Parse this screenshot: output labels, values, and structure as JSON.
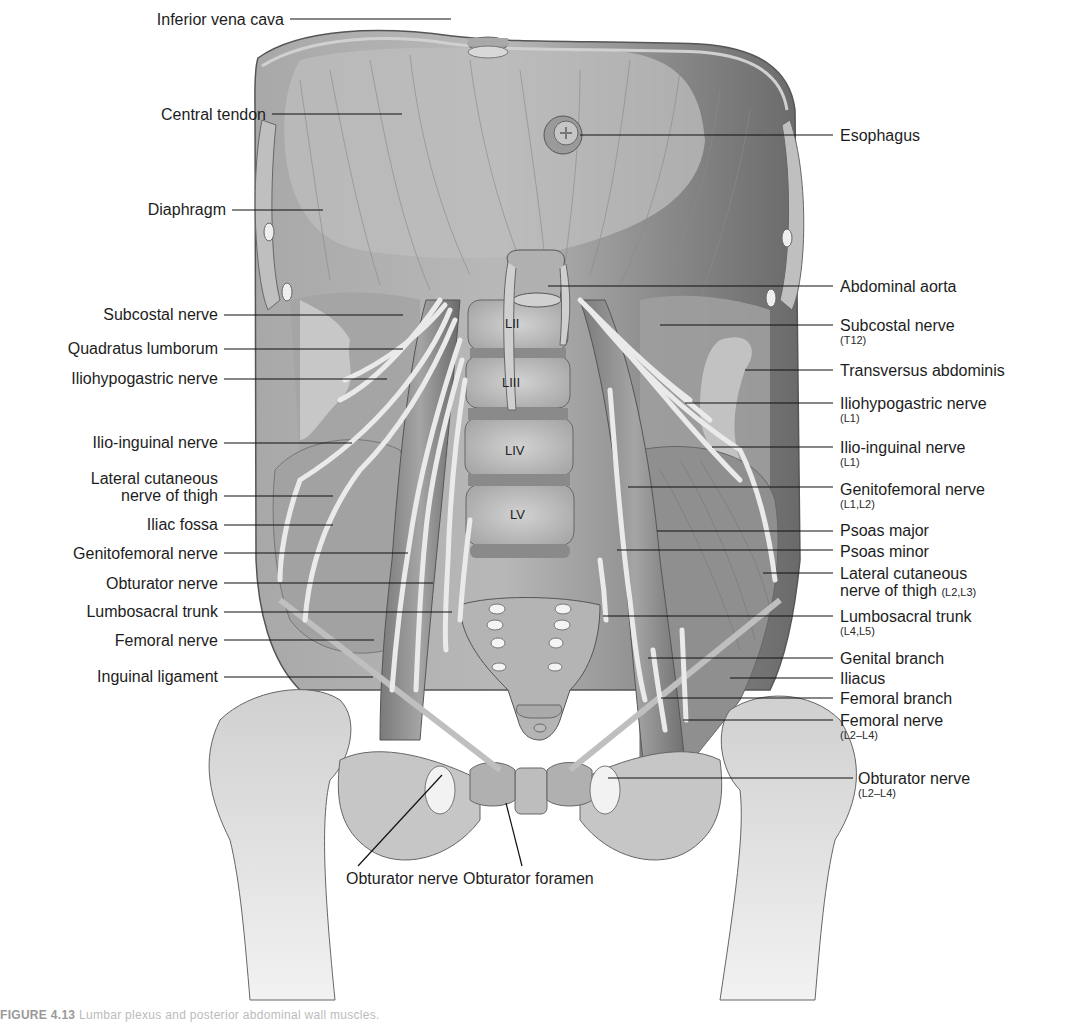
{
  "figure": {
    "type": "anatomical-illustration",
    "palette": {
      "background": "#ffffff",
      "muscle_light": "#b4b4b4",
      "muscle_mid": "#9a9a9a",
      "muscle_dark": "#6e6e6e",
      "bone": "#d9d9d9",
      "nerve": "#e6e6e6",
      "leader_line": "#111111",
      "text": "#1d1d1d"
    }
  },
  "vertebrae": [
    {
      "label": "LII",
      "x": 505,
      "y": 322
    },
    {
      "label": "LIII",
      "x": 503,
      "y": 380
    },
    {
      "label": "LIV",
      "x": 507,
      "y": 449
    },
    {
      "label": "LV",
      "x": 511,
      "y": 514
    }
  ],
  "labels_left": [
    {
      "text": "Inferior vena cava",
      "sub": "",
      "x": 135,
      "y": 11,
      "line": [
        [
          290,
          19
        ],
        [
          451,
          19
        ]
      ]
    },
    {
      "text": "Central tendon",
      "sub": "",
      "x": 135,
      "y": 106,
      "line": [
        [
          272,
          114
        ],
        [
          402,
          114
        ]
      ]
    },
    {
      "text": "Diaphragm",
      "sub": "",
      "x": 135,
      "y": 201,
      "line": [
        [
          232,
          210
        ],
        [
          323,
          210
        ]
      ]
    },
    {
      "text": "Subcostal nerve",
      "sub": "",
      "x": 75,
      "y": 306,
      "line": [
        [
          224,
          315
        ],
        [
          403,
          315
        ]
      ]
    },
    {
      "text": "Quadratus lumborum",
      "sub": "",
      "x": 33,
      "y": 340,
      "line": [
        [
          224,
          349
        ],
        [
          403,
          349
        ]
      ]
    },
    {
      "text": "Iliohypogastric nerve",
      "sub": "",
      "x": 38,
      "y": 370,
      "line": [
        [
          224,
          379
        ],
        [
          387,
          379
        ]
      ]
    },
    {
      "text": "Ilio-inguinal nerve",
      "sub": "",
      "x": 64,
      "y": 434,
      "line": [
        [
          224,
          443
        ],
        [
          352,
          443
        ]
      ]
    },
    {
      "text": "Lateral cutaneous",
      "sub": "nerve of thigh",
      "x": 62,
      "y": 470,
      "line": [
        [
          224,
          496
        ],
        [
          333,
          496
        ]
      ]
    },
    {
      "text": "Iliac fossa",
      "sub": "",
      "x": 132,
      "y": 514,
      "line": [
        [
          224,
          525
        ],
        [
          333,
          525
        ]
      ]
    },
    {
      "text": "Genitofemoral nerve",
      "sub": "",
      "x": 40,
      "y": 545,
      "line": [
        [
          224,
          553
        ],
        [
          408,
          553
        ]
      ]
    },
    {
      "text": "Obturator nerve",
      "sub": "",
      "x": 80,
      "y": 575,
      "line": [
        [
          224,
          583
        ],
        [
          433,
          583
        ]
      ]
    },
    {
      "text": "Lumbosacral trunk",
      "sub": "",
      "x": 56,
      "y": 603,
      "line": [
        [
          224,
          612
        ],
        [
          452,
          612
        ]
      ]
    },
    {
      "text": "Femoral nerve",
      "sub": "",
      "x": 92,
      "y": 631,
      "line": [
        [
          224,
          640
        ],
        [
          374,
          640
        ]
      ]
    },
    {
      "text": "Inguinal ligament",
      "sub": "",
      "x": 68,
      "y": 667,
      "line": [
        [
          224,
          677
        ],
        [
          373,
          677
        ]
      ]
    }
  ],
  "labels_right": [
    {
      "text": "Esophagus",
      "sub": "",
      "x": 840,
      "y": 130,
      "line": [
        [
          580,
          135
        ],
        [
          833,
          135
        ]
      ]
    },
    {
      "text": "Abdominal aorta",
      "sub": "",
      "x": 840,
      "y": 281,
      "line": [
        [
          548,
          286
        ],
        [
          833,
          286
        ]
      ]
    },
    {
      "text": "Subcostal nerve",
      "sub": "(T12)",
      "x": 840,
      "y": 318,
      "line": [
        [
          660,
          325
        ],
        [
          833,
          325
        ]
      ]
    },
    {
      "text": "Transversus abdominis",
      "sub": "",
      "x": 840,
      "y": 362,
      "line": [
        [
          745,
          370
        ],
        [
          833,
          370
        ]
      ]
    },
    {
      "text": "Iliohypogastric nerve",
      "sub": "(L1)",
      "x": 840,
      "y": 398,
      "line": [
        [
          685,
          403
        ],
        [
          833,
          403
        ]
      ]
    },
    {
      "text": "Ilio-inguinal nerve",
      "sub": "(L1)",
      "x": 840,
      "y": 442,
      "line": [
        [
          712,
          447
        ],
        [
          833,
          447
        ]
      ]
    },
    {
      "text": "Genitofemoral nerve",
      "sub": "(L1,L2)",
      "x": 840,
      "y": 481,
      "line": [
        [
          628,
          487
        ],
        [
          833,
          487
        ]
      ]
    },
    {
      "text": "Psoas major",
      "sub": "",
      "x": 840,
      "y": 522,
      "line": [
        [
          657,
          531
        ],
        [
          833,
          531
        ]
      ]
    },
    {
      "text": "Psoas minor",
      "sub": "",
      "x": 840,
      "y": 543,
      "line": [
        [
          617,
          550
        ],
        [
          833,
          550
        ]
      ]
    },
    {
      "text": "Lateral cutaneous",
      "sub": "",
      "inline_sub": "(L2,L3)",
      "second_line": "nerve of thigh",
      "x": 840,
      "y": 565,
      "line": [
        [
          763,
          573
        ],
        [
          833,
          573
        ]
      ]
    },
    {
      "text": "Lumbosacral trunk",
      "sub": "(L4,L5)",
      "x": 840,
      "y": 610,
      "line": [
        [
          603,
          616
        ],
        [
          833,
          616
        ]
      ]
    },
    {
      "text": "Genital branch",
      "sub": "",
      "x": 840,
      "y": 651,
      "line": [
        [
          648,
          658
        ],
        [
          833,
          658
        ]
      ]
    },
    {
      "text": "Iliacus",
      "sub": "",
      "x": 840,
      "y": 672,
      "line": [
        [
          730,
          678
        ],
        [
          833,
          678
        ]
      ]
    },
    {
      "text": "Femoral branch",
      "sub": "",
      "x": 840,
      "y": 692,
      "line": [
        [
          661,
          698
        ],
        [
          833,
          698
        ]
      ]
    },
    {
      "text": "Femoral nerve",
      "sub": "(L2–L4)",
      "x": 840,
      "y": 714,
      "line": [
        [
          683,
          720
        ],
        [
          833,
          720
        ]
      ]
    },
    {
      "text": "Obturator nerve",
      "sub": "(L2–L4)",
      "x": 858,
      "y": 772,
      "line": [
        [
          608,
          778
        ],
        [
          853,
          778
        ]
      ]
    }
  ],
  "labels_bottom": [
    {
      "text": "Obturator nerve",
      "x": 346,
      "y": 870,
      "line": [
        [
          358,
          866
        ],
        [
          442,
          775
        ]
      ]
    },
    {
      "text": "Obturator foramen",
      "x": 463,
      "y": 870,
      "line": [
        [
          522,
          866
        ],
        [
          506,
          803
        ]
      ]
    }
  ],
  "caption": {
    "prefix": "FIGURE 4.13",
    "text": "  Lumbar plexus and posterior abdominal wall muscles."
  }
}
